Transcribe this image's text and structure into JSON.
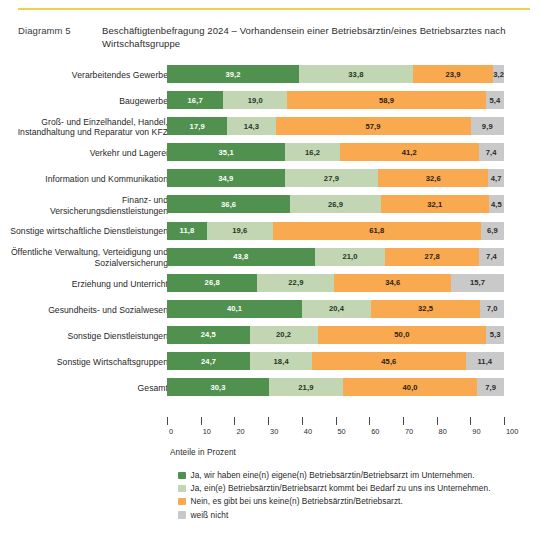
{
  "header": {
    "kicker": "Diagramm 5",
    "title": "Beschäftigtenbefragung 2024 – Vorhandensein einer Betriebsärztin/eines Betriebsarztes nach Wirtschaftsgruppe"
  },
  "axis_caption": "Anteile in Prozent",
  "colors": {
    "series_0": "#51914f",
    "series_1": "#c3d6b4",
    "series_2": "#f9a94f",
    "series_3": "#c9c9c9",
    "rule": "#e8d44a"
  },
  "chart_data": {
    "type": "bar",
    "orientation": "horizontal",
    "stacked": true,
    "title": "Beschäftigtenbefragung 2024 – Vorhandensein einer Betriebsärztin/eines Betriebsarztes nach Wirtschaftsgruppe",
    "xlabel": "Anteile in Prozent",
    "ylabel": "",
    "xlim": [
      0,
      100
    ],
    "xticks": [
      0,
      10,
      20,
      30,
      40,
      50,
      60,
      70,
      80,
      90,
      100
    ],
    "xticklabels": [
      "0",
      "10",
      "20",
      "30",
      "40",
      "50",
      "60",
      "70",
      "80",
      "90",
      "100"
    ],
    "grid": false,
    "legend_position": "bottom",
    "categories": [
      "Verarbeitendes Gewerbe",
      "Baugewerbe",
      "Groß- und Einzelhandel, Handel, Instandhaltung und Reparatur von KFZ",
      "Verkehr und Lagerei",
      "Information und Kommunikation",
      "Finanz- und Versicherungsdienstleistungen",
      "Sonstige wirtschaftliche Dienstleistungen",
      "Öffentliche Verwaltung, Verteidigung und Sozialversicherung",
      "Erziehung und Unterricht",
      "Gesundheits- und Sozialwesen",
      "Sonstige Dienstleistungen",
      "Sonstige Wirtschaftsgruppen",
      "Gesamt"
    ],
    "series": [
      {
        "name": "Ja, wir haben eine(n) eigene(n) Betriebsärztin/Betriebsarzt im Unternehmen.",
        "color": "#51914f",
        "values": [
          39.2,
          16.7,
          17.9,
          35.1,
          34.9,
          36.6,
          11.8,
          43.8,
          26.8,
          40.1,
          24.5,
          24.7,
          30.3
        ],
        "labels": [
          "39,2",
          "16,7",
          "17,9",
          "35,1",
          "34,9",
          "36,6",
          "11,8",
          "43,8",
          "26,8",
          "40,1",
          "24,5",
          "24,7",
          "30,3"
        ]
      },
      {
        "name": "Ja, ein(e) Betriebsärztin/Betriebsarzt kommt bei Bedarf zu uns ins Unternehmen.",
        "color": "#c3d6b4",
        "values": [
          33.8,
          19.0,
          14.3,
          16.2,
          27.9,
          26.9,
          19.6,
          21.0,
          22.9,
          20.4,
          20.2,
          18.4,
          21.9
        ],
        "labels": [
          "33,8",
          "19,0",
          "14,3",
          "16,2",
          "27,9",
          "26,9",
          "19,6",
          "21,0",
          "22,9",
          "20,4",
          "20,2",
          "18,4",
          "21,9"
        ]
      },
      {
        "name": "Nein, es gibt bei uns keine(n) Betriebsärztin/Betriebsarzt.",
        "color": "#f9a94f",
        "values": [
          23.9,
          58.9,
          57.9,
          41.2,
          32.6,
          32.1,
          61.8,
          27.8,
          34.6,
          32.5,
          50.0,
          45.6,
          40.0
        ],
        "labels": [
          "23,9",
          "58,9",
          "57,9",
          "41,2",
          "32,6",
          "32,1",
          "61,8",
          "27,8",
          "34,6",
          "32,5",
          "50,0",
          "45,6",
          "40,0"
        ]
      },
      {
        "name": "weiß nicht",
        "color": "#c9c9c9",
        "values": [
          3.2,
          5.4,
          9.9,
          7.4,
          4.7,
          4.5,
          6.9,
          7.4,
          15.7,
          7.0,
          5.3,
          11.4,
          7.9
        ],
        "labels": [
          "3,2",
          "5,4",
          "9,9",
          "7,4",
          "4,7",
          "4,5",
          "6,9",
          "7,4",
          "15,7",
          "7,0",
          "5,3",
          "11,4",
          "7,9"
        ]
      }
    ]
  },
  "legend": [
    {
      "label": "Ja, wir haben eine(n) eigene(n) Betriebsärztin/Betriebsarzt im Unternehmen.",
      "color": "#51914f"
    },
    {
      "label": "Ja, ein(e) Betriebsärztin/Betriebsarzt kommt bei Bedarf zu uns ins Unternehmen.",
      "color": "#c3d6b4"
    },
    {
      "label": "Nein, es gibt bei uns keine(n) Betriebsärztin/Betriebsarzt.",
      "color": "#f9a94f"
    },
    {
      "label": "weiß nicht",
      "color": "#c9c9c9"
    }
  ]
}
